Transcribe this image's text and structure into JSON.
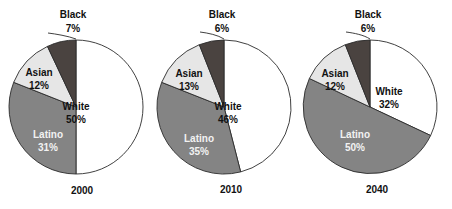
{
  "chart_data": [
    {
      "type": "pie",
      "title": "2000",
      "categories": [
        "White",
        "Latino",
        "Asian",
        "Black"
      ],
      "values": [
        50,
        31,
        12,
        7
      ],
      "value_labels": [
        "50%",
        "31%",
        "12%",
        "7%"
      ],
      "colors": [
        "#ffffff",
        "#848484",
        "#e6e6e6",
        "#4a4340"
      ],
      "legend": "none",
      "grid": false,
      "xlabel": "",
      "ylabel": ""
    },
    {
      "type": "pie",
      "title": "2010",
      "categories": [
        "White",
        "Latino",
        "Asian",
        "Black"
      ],
      "values": [
        46,
        35,
        13,
        6
      ],
      "value_labels": [
        "46%",
        "35%",
        "13%",
        "6%"
      ],
      "colors": [
        "#ffffff",
        "#848484",
        "#e6e6e6",
        "#4a4340"
      ],
      "legend": "none",
      "grid": false,
      "xlabel": "",
      "ylabel": ""
    },
    {
      "type": "pie",
      "title": "2040",
      "categories": [
        "White",
        "Latino",
        "Asian",
        "Black"
      ],
      "values": [
        32,
        50,
        12,
        6
      ],
      "value_labels": [
        "32%",
        "50%",
        "12%",
        "6%"
      ],
      "colors": [
        "#ffffff",
        "#848484",
        "#e6e6e6",
        "#4a4340"
      ],
      "legend": "none",
      "grid": false,
      "xlabel": "",
      "ylabel": ""
    }
  ],
  "charts": [
    {
      "year": "2000",
      "slices": {
        "white": {
          "name": "White",
          "pct": "50%"
        },
        "latino": {
          "name": "Latino",
          "pct": "31%"
        },
        "asian": {
          "name": "Asian",
          "pct": "12%"
        },
        "black": {
          "name": "Black",
          "pct": "7%"
        }
      }
    },
    {
      "year": "2010",
      "slices": {
        "white": {
          "name": "White",
          "pct": "46%"
        },
        "latino": {
          "name": "Latino",
          "pct": "35%"
        },
        "asian": {
          "name": "Asian",
          "pct": "13%"
        },
        "black": {
          "name": "Black",
          "pct": "6%"
        }
      }
    },
    {
      "year": "2040",
      "slices": {
        "white": {
          "name": "White",
          "pct": "32%"
        },
        "latino": {
          "name": "Latino",
          "pct": "50%"
        },
        "asian": {
          "name": "Asian",
          "pct": "12%"
        },
        "black": {
          "name": "Black",
          "pct": "6%"
        }
      }
    }
  ]
}
